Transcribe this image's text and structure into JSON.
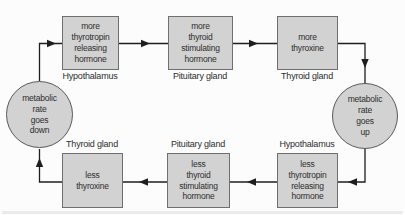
{
  "nodes": {
    "top": [
      {
        "text": "more\nthyrotropin\nreleasing\nhormone",
        "organ": "Hypothalamus"
      },
      {
        "text": "more\nthyroid\nstimulating\nhormone",
        "organ": "Pituitary gland"
      },
      {
        "text": "more\nthyroxine",
        "organ": "Thyroid gland"
      }
    ],
    "bottom": [
      {
        "text": "less\nthyroxine",
        "organ": "Thyroid gland"
      },
      {
        "text": "less\nthyroid\nstimulating\nhormone",
        "organ": "Pituitary gland"
      },
      {
        "text": "less\nthyrotropin\nreleasing\nhormone",
        "organ": "Hypothalamus"
      }
    ],
    "circles": [
      {
        "text": "metabolic\nrate\ngoes\ndown"
      },
      {
        "text": "metabolic\nrate\ngoes\nup"
      }
    ]
  },
  "colors": {
    "background": "#fcfcfc",
    "node_fill": "#d2d2d2",
    "node_border": "#6f6f6f",
    "circle_border": "#5a5a5a",
    "line": "#1e1e1e",
    "text": "#2d2d2d"
  }
}
